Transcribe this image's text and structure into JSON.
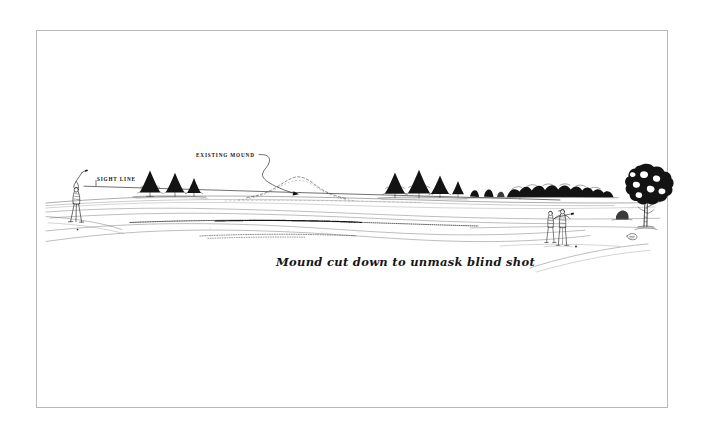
{
  "page": {
    "background_color": "#ffffff",
    "width": 702,
    "height": 439
  },
  "frame": {
    "border_color": "#b8b8b8",
    "fill_color": "#ffffff"
  },
  "illustration": {
    "title": "Golf course grading concept sketch",
    "medium": "pen and ink line drawing",
    "ink_color": "#111111",
    "elements": [
      "golfer-swinging",
      "sight-line",
      "evergreen-tree-cluster-left",
      "existing-mound-dashed-outline",
      "evergreen-tree-cluster-right",
      "distant-shrub-treeline",
      "two-standing-figures",
      "large-deciduous-tree",
      "fairway-contour-lines"
    ]
  },
  "labels": {
    "sight_line": "SIGHT LINE",
    "existing_mound": "EXISTING MOUND",
    "caption": "Mound cut down to unmask blind shot"
  }
}
